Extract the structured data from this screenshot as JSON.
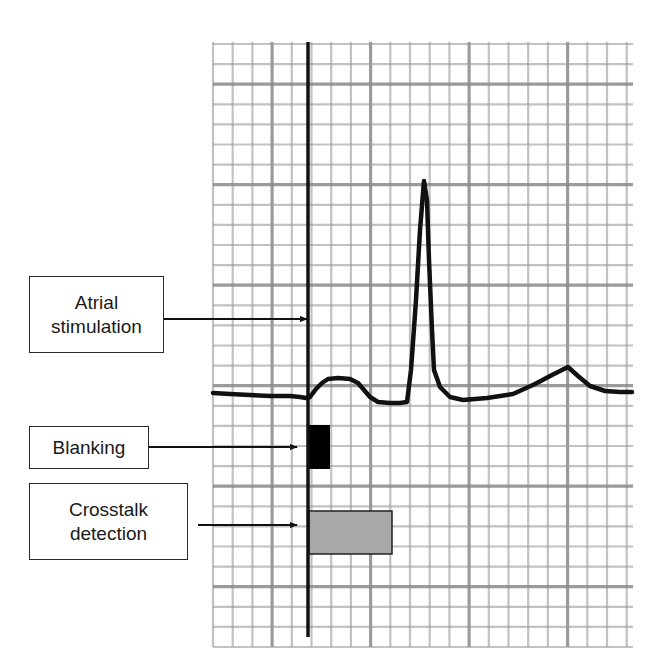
{
  "figure": {
    "type": "annotated ECG strip",
    "grid": {
      "left": 213,
      "top": 42,
      "right": 633,
      "bottom": 647,
      "minor_spacing_x": 19.7,
      "minor_spacing_y": 20.1,
      "major_every": 5,
      "minor_color": "#9a9a9a",
      "major_color": "#8a8a8a"
    },
    "trace_color": "#111111",
    "stimulation_line": {
      "x": 308,
      "y_top": 42,
      "y_bottom": 637,
      "color": "#111111"
    },
    "blanking_block": {
      "x": 307,
      "y": 425,
      "width": 23,
      "height": 44,
      "color": "#000000"
    },
    "crosstalk_block": {
      "x": 309,
      "y": 511,
      "width": 83,
      "height": 43,
      "color": "#a8a8a8",
      "border": "#222222"
    },
    "ecg_points": [
      [
        213,
        393
      ],
      [
        230,
        394
      ],
      [
        250,
        395
      ],
      [
        270,
        396
      ],
      [
        290,
        396
      ],
      [
        300,
        397
      ],
      [
        306,
        398
      ],
      [
        310,
        397
      ],
      [
        316,
        389
      ],
      [
        322,
        383
      ],
      [
        328,
        379
      ],
      [
        338,
        378
      ],
      [
        350,
        379
      ],
      [
        358,
        383
      ],
      [
        364,
        390
      ],
      [
        370,
        397
      ],
      [
        378,
        402
      ],
      [
        390,
        403
      ],
      [
        400,
        403
      ],
      [
        407,
        402
      ],
      [
        411,
        370
      ],
      [
        416,
        300
      ],
      [
        420,
        230
      ],
      [
        424,
        181
      ],
      [
        427,
        200
      ],
      [
        429,
        260
      ],
      [
        432,
        330
      ],
      [
        434,
        370
      ],
      [
        440,
        387
      ],
      [
        450,
        397
      ],
      [
        463,
        400
      ],
      [
        487,
        398
      ],
      [
        513,
        394
      ],
      [
        535,
        384
      ],
      [
        552,
        375
      ],
      [
        568,
        367
      ],
      [
        578,
        376
      ],
      [
        590,
        386
      ],
      [
        605,
        391
      ],
      [
        620,
        392
      ],
      [
        632,
        392
      ]
    ]
  },
  "labels": [
    {
      "id": "atrial-stimulation",
      "lines": [
        "Atrial",
        "stimulation"
      ],
      "box": {
        "x": 29,
        "y": 276,
        "w": 135,
        "h": 77
      },
      "arrow": {
        "x1": 164,
        "y1": 319,
        "x2": 307,
        "y2": 319
      }
    },
    {
      "id": "blanking",
      "lines": [
        "Blanking"
      ],
      "box": {
        "x": 29,
        "y": 426,
        "w": 120,
        "h": 43
      },
      "arrow": {
        "x1": 149,
        "y1": 447,
        "x2": 297,
        "y2": 447
      }
    },
    {
      "id": "crosstalk-detection",
      "lines": [
        "Crosstalk",
        "detection"
      ],
      "box": {
        "x": 29,
        "y": 483,
        "w": 159,
        "h": 77
      },
      "arrow": {
        "x1": 198,
        "y1": 525,
        "x2": 297,
        "y2": 525
      }
    }
  ]
}
